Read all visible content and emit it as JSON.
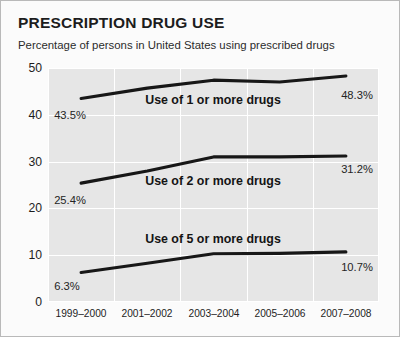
{
  "chart_data": {
    "type": "line",
    "title": "PRESCRIPTION DRUG USE",
    "subtitle": "Percentage of persons in United States using prescribed drugs",
    "xlabel": "",
    "ylabel": "",
    "categories": [
      "1999–2000",
      "2001–2002",
      "2003–2004",
      "2005–2006",
      "2007–2008"
    ],
    "ylim": [
      0,
      50
    ],
    "yticks": [
      0,
      10,
      20,
      30,
      40,
      50
    ],
    "grid": true,
    "legend_position": "inline-on-lines",
    "series": [
      {
        "name": "Use of 1 or more drugs",
        "values": [
          43.5,
          45.7,
          47.4,
          47.0,
          48.3
        ],
        "start_label": "43.5%",
        "end_label": "48.3%"
      },
      {
        "name": "Use of 2 or more drugs",
        "values": [
          25.4,
          28.0,
          31.0,
          31.0,
          31.2
        ],
        "start_label": "25.4%",
        "end_label": "31.2%"
      },
      {
        "name": "Use of 5 or more drugs",
        "values": [
          6.3,
          8.3,
          10.3,
          10.4,
          10.7
        ],
        "start_label": "6.3%",
        "end_label": "10.7%"
      }
    ],
    "colors": {
      "line": "#171717",
      "plot_background": "#e6e6e6",
      "gridline": "#ffffff",
      "figure_background": "#fbfbfb",
      "border": "#b9b9b9",
      "text": "#1d1d1d"
    }
  },
  "annotations": {
    "series_labels": [
      "Use of 1 or more drugs",
      "Use of 2 or more drugs",
      "Use of 5 or more drugs"
    ],
    "value_labels": [
      "43.5%",
      "48.3%",
      "25.4%",
      "31.2%",
      "6.3%",
      "10.7%"
    ]
  }
}
